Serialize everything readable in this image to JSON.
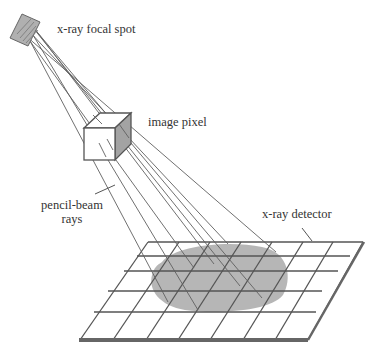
{
  "diagram": {
    "labels": {
      "focal_spot": "x-ray focal spot",
      "image_pixel": "image pixel",
      "pencil_beam_line1": "pencil-beam",
      "pencil_beam_line2": "rays",
      "detector": "x-ray detector"
    },
    "colors": {
      "line": "#555555",
      "shade": "#9a9a9a",
      "blob": "#a8a8a8",
      "detector_edge": "#666666",
      "text": "#333333"
    },
    "detector_grid": {
      "rows": 5,
      "columns": 7
    }
  }
}
